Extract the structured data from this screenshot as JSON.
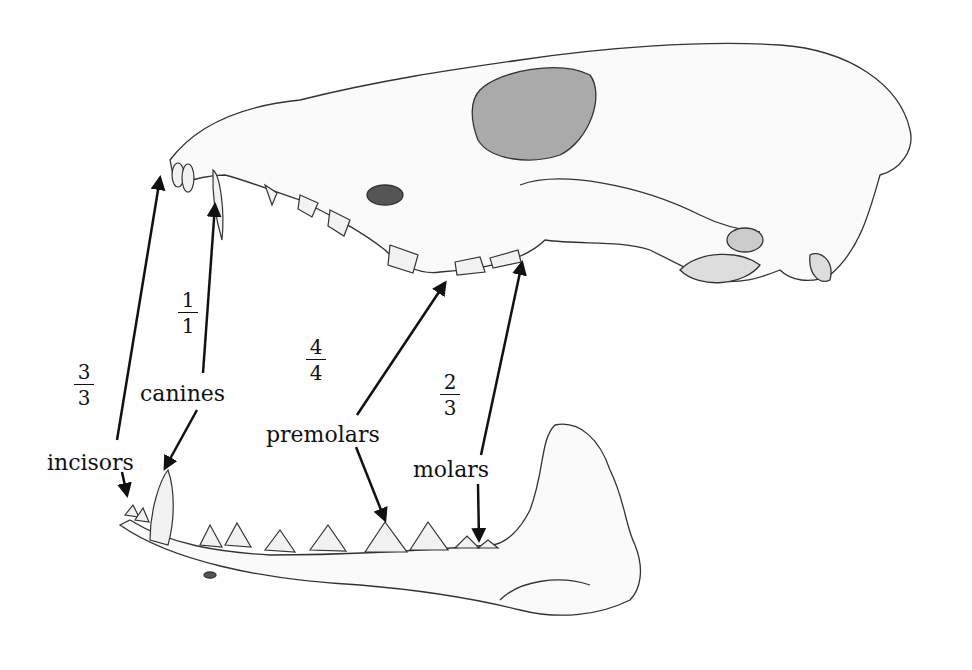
{
  "diagram": {
    "labels": {
      "incisors": "incisors",
      "canines": "canines",
      "premolars": "premolars",
      "molars": "molars"
    },
    "fractions": {
      "incisors": {
        "upper": "3",
        "lower": "3"
      },
      "canines": {
        "upper": "1",
        "lower": "1"
      },
      "premolars": {
        "upper": "4",
        "lower": "4"
      },
      "molars": {
        "upper": "2",
        "lower": "3"
      }
    }
  }
}
